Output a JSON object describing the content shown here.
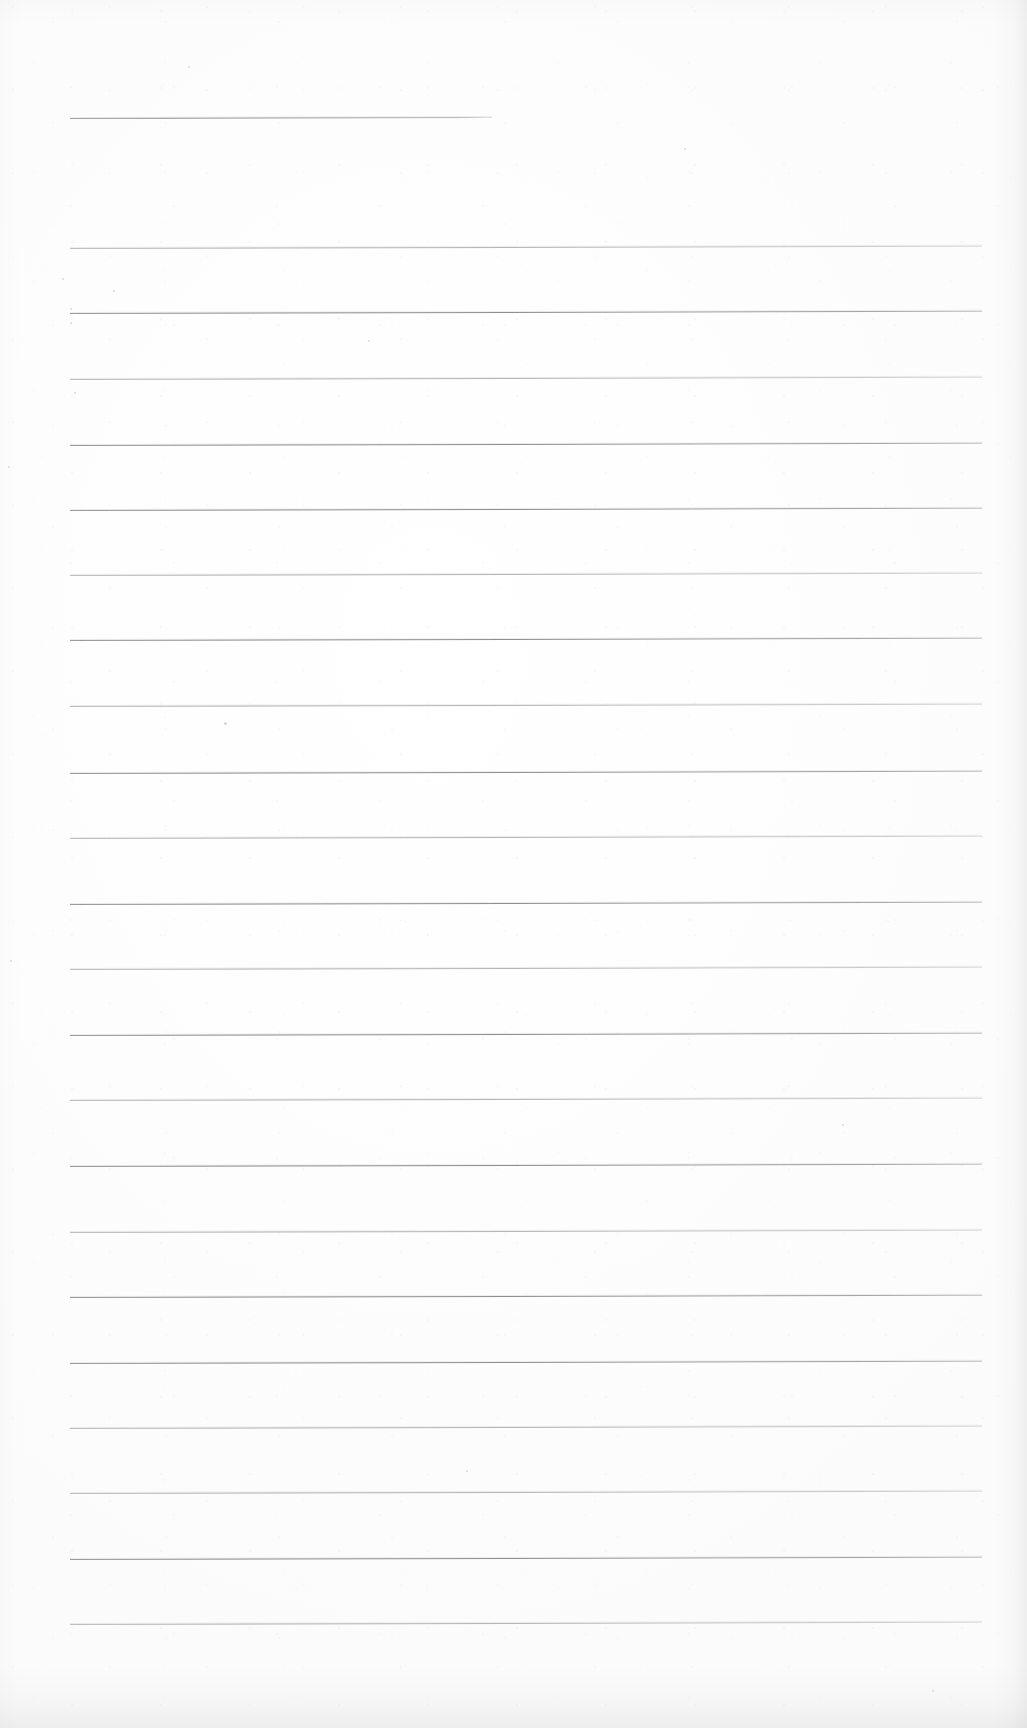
{
  "document": {
    "kind": "scanned-ruled-notepad-page",
    "title": "",
    "body_text": "",
    "page_width": 1027,
    "page_height": 1728,
    "paper_color": "#fdfdfd",
    "rule_color": "#8e8e8e",
    "rule_color_faint": "#aeaeae",
    "content_note": "blank page — no handwriting, no printed text",
    "writing_lines_count": 22,
    "header_rule_count": 1
  },
  "layout": {
    "rule_left_x": 70,
    "rule_right_x": 982,
    "header_rule_right_x": 492,
    "first_rule_y": 118,
    "body_first_rule_y": 248,
    "rule_spacing": 65.3,
    "skew_deg": -0.14
  },
  "rules": [
    {
      "id": "header-rule",
      "y": 118,
      "x1": 70,
      "x2": 492,
      "weight": "solid",
      "role": "header-rule"
    },
    {
      "id": "rule-01",
      "y": 248,
      "x1": 70,
      "x2": 982,
      "weight": "faint",
      "role": "writing-line"
    },
    {
      "id": "rule-02",
      "y": 313,
      "x1": 70,
      "x2": 982,
      "weight": "solid",
      "role": "writing-line"
    },
    {
      "id": "rule-03",
      "y": 379,
      "x1": 70,
      "x2": 982,
      "weight": "faint",
      "role": "writing-line"
    },
    {
      "id": "rule-04",
      "y": 445,
      "x1": 70,
      "x2": 982,
      "weight": "solid",
      "role": "writing-line"
    },
    {
      "id": "rule-05",
      "y": 510,
      "x1": 70,
      "x2": 982,
      "weight": "solid",
      "role": "writing-line"
    },
    {
      "id": "rule-06",
      "y": 575,
      "x1": 70,
      "x2": 982,
      "weight": "faint",
      "role": "writing-line"
    },
    {
      "id": "rule-07",
      "y": 640,
      "x1": 70,
      "x2": 982,
      "weight": "solid",
      "role": "writing-line"
    },
    {
      "id": "rule-08",
      "y": 706,
      "x1": 70,
      "x2": 982,
      "weight": "faint",
      "role": "writing-line"
    },
    {
      "id": "rule-09",
      "y": 773,
      "x1": 70,
      "x2": 982,
      "weight": "solid",
      "role": "writing-line"
    },
    {
      "id": "rule-10",
      "y": 838,
      "x1": 70,
      "x2": 982,
      "weight": "faint",
      "role": "writing-line"
    },
    {
      "id": "rule-11",
      "y": 904,
      "x1": 70,
      "x2": 982,
      "weight": "solid",
      "role": "writing-line"
    },
    {
      "id": "rule-12",
      "y": 969,
      "x1": 70,
      "x2": 982,
      "weight": "faint",
      "role": "writing-line"
    },
    {
      "id": "rule-13",
      "y": 1035,
      "x1": 70,
      "x2": 982,
      "weight": "solid",
      "role": "writing-line"
    },
    {
      "id": "rule-14",
      "y": 1100,
      "x1": 70,
      "x2": 982,
      "weight": "faint",
      "role": "writing-line"
    },
    {
      "id": "rule-15",
      "y": 1166,
      "x1": 70,
      "x2": 982,
      "weight": "solid",
      "role": "writing-line"
    },
    {
      "id": "rule-16",
      "y": 1232,
      "x1": 70,
      "x2": 982,
      "weight": "faint",
      "role": "writing-line"
    },
    {
      "id": "rule-17",
      "y": 1297,
      "x1": 70,
      "x2": 982,
      "weight": "solid",
      "role": "writing-line"
    },
    {
      "id": "rule-18",
      "y": 1363,
      "x1": 70,
      "x2": 982,
      "weight": "solid",
      "role": "writing-line"
    },
    {
      "id": "rule-19",
      "y": 1428,
      "x1": 70,
      "x2": 982,
      "weight": "faint",
      "role": "writing-line"
    },
    {
      "id": "rule-20",
      "y": 1493,
      "x1": 70,
      "x2": 982,
      "weight": "faint",
      "role": "writing-line"
    },
    {
      "id": "rule-21",
      "y": 1559,
      "x1": 70,
      "x2": 982,
      "weight": "solid",
      "role": "writing-line"
    },
    {
      "id": "rule-22",
      "y": 1624,
      "x1": 70,
      "x2": 982,
      "weight": "faint",
      "role": "writing-line"
    }
  ],
  "specks": [
    {
      "x": 188,
      "y": 66,
      "size": 2
    },
    {
      "x": 684,
      "y": 148,
      "size": 2
    },
    {
      "x": 62,
      "y": 278,
      "size": 2
    },
    {
      "x": 113,
      "y": 290,
      "size": 2
    },
    {
      "x": 70,
      "y": 308,
      "size": 2
    },
    {
      "x": 70,
      "y": 322,
      "size": 2
    },
    {
      "x": 368,
      "y": 340,
      "size": 2
    },
    {
      "x": 74,
      "y": 392,
      "size": 2
    },
    {
      "x": 8,
      "y": 466,
      "size": 2
    },
    {
      "x": 224,
      "y": 722,
      "size": 3
    },
    {
      "x": 10,
      "y": 960,
      "size": 2
    },
    {
      "x": 842,
      "y": 1124,
      "size": 2
    },
    {
      "x": 466,
      "y": 1470,
      "size": 2
    },
    {
      "x": 932,
      "y": 1690,
      "size": 2
    }
  ]
}
